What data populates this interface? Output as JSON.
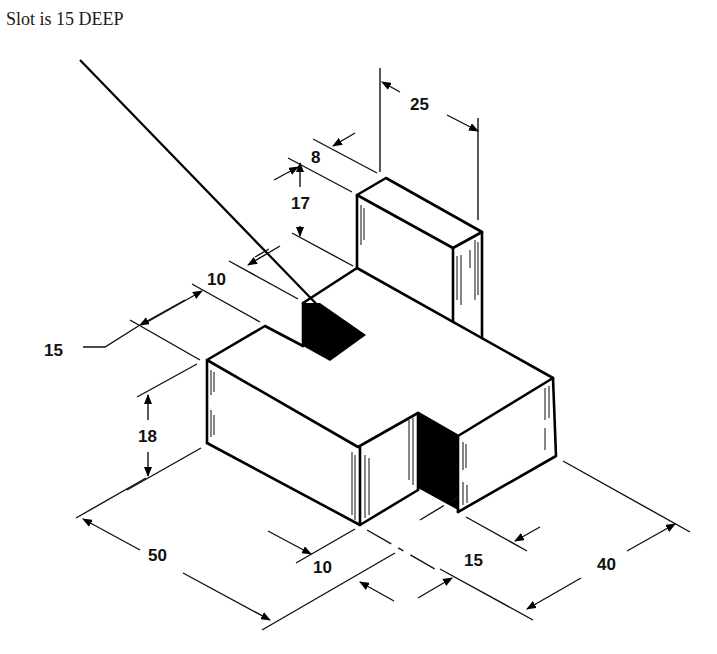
{
  "note": {
    "text": "Slot is 15 DEEP"
  },
  "dimensions": {
    "upright_width": "25",
    "upright_thickness": "8",
    "upright_height": "17",
    "slot_width_top": "10",
    "step_depth": "15",
    "base_height": "18",
    "base_length": "50",
    "front_slot_offset": "10",
    "front_slot_width": "15",
    "base_depth": "40"
  },
  "colors": {
    "line": "#000000",
    "background": "#ffffff",
    "fill_shadow": "#000000"
  }
}
